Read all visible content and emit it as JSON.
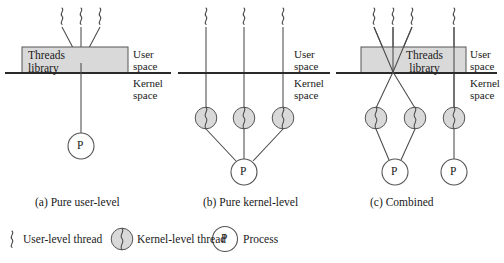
{
  "figure": {
    "colors": {
      "line": "#3a3a3a",
      "box_fill": "#d8d8d8",
      "box_stroke": "#555555",
      "circle_fill": "#d8d8d8",
      "circle_stroke": "#555555",
      "process_fill": "#ffffff",
      "text": "#1a1a1a"
    },
    "panels": [
      {
        "id": "a",
        "caption": "(a) Pure user-level",
        "threads_library_label": "Threads\nlibrary",
        "threads_library_line1": "Threads",
        "threads_library_line2": "library",
        "user_space_label": "User\nspace",
        "user_space_line1": "User",
        "user_space_line2": "space",
        "kernel_space_label": "Kernel\nspace",
        "kernel_space_line1": "Kernel",
        "kernel_space_line2": "space",
        "user_level_threads": 3,
        "kernel_level_threads": 0,
        "processes": 1,
        "process_label": "P"
      },
      {
        "id": "b",
        "caption": "(b) Pure kernel-level",
        "threads_library_label": "",
        "user_space_line1": "User",
        "user_space_line2": "space",
        "kernel_space_line1": "Kernel",
        "kernel_space_line2": "space",
        "user_level_threads": 3,
        "kernel_level_threads": 3,
        "processes": 1,
        "process_label": "P"
      },
      {
        "id": "c",
        "caption": "(c) Combined",
        "threads_library_line1": "Threads",
        "threads_library_line2": "library",
        "user_space_line1": "User",
        "user_space_line2": "space",
        "kernel_space_line1": "Kernel",
        "kernel_space_line2": "space",
        "user_level_threads": 4,
        "kernel_level_threads": 3,
        "processes": 2,
        "process_label": "P"
      }
    ],
    "legend": [
      {
        "icon": "squiggle-icon",
        "label": "User-level thread"
      },
      {
        "icon": "kernel-thread-circle-icon",
        "label": "Kernel-level thread"
      },
      {
        "icon": "process-circle-icon",
        "label": "Process",
        "glyph": "P"
      }
    ]
  }
}
